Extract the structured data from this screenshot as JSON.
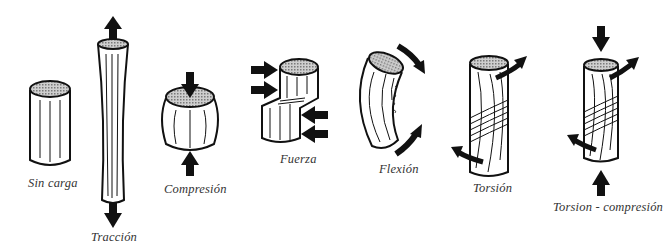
{
  "diagram": {
    "figures": [
      {
        "id": "sin-carga",
        "label": "Sin carga",
        "forces": []
      },
      {
        "id": "traccion",
        "label": "Tracción",
        "forces": [
          "arrow-up",
          "arrow-down"
        ]
      },
      {
        "id": "compresion",
        "label": "Compresión",
        "forces": [
          "arrow-down",
          "arrow-up"
        ]
      },
      {
        "id": "fuerza",
        "label": "Fuerza",
        "forces": [
          "arrow-right",
          "arrow-right",
          "arrow-left",
          "arrow-left"
        ]
      },
      {
        "id": "flexion",
        "label": "Flexión",
        "forces": [
          "curved-arrow",
          "curved-arrow"
        ]
      },
      {
        "id": "torsion",
        "label": "Torsión",
        "forces": [
          "twist-arrow",
          "twist-arrow"
        ]
      },
      {
        "id": "torsion-compresion",
        "label": "Torsion - compresión",
        "forces": [
          "arrow-down",
          "arrow-up",
          "twist-arrow",
          "twist-arrow"
        ]
      }
    ],
    "colors": {
      "outline": "#111111",
      "hatch": "#9a9a9a",
      "background": "#ffffff",
      "text": "#333333"
    }
  }
}
